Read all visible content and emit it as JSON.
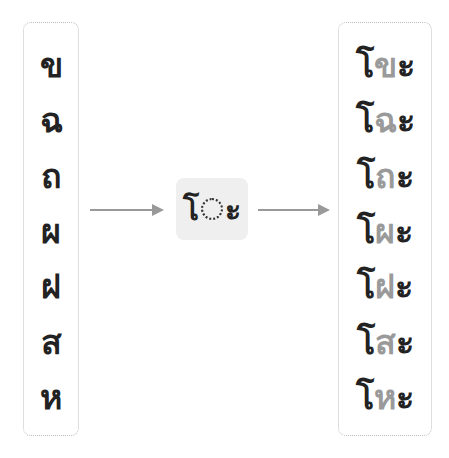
{
  "left_column": {
    "consonants": [
      "ข",
      "ฉ",
      "ถ",
      "ผ",
      "ฝ",
      "ส",
      "ห"
    ]
  },
  "center": {
    "prefix": "โ",
    "placeholder": "dotted-circle",
    "suffix": "ะ"
  },
  "right_column": {
    "rows": [
      {
        "pre": "โ",
        "cons": "ข",
        "post": "ะ"
      },
      {
        "pre": "โ",
        "cons": "ฉ",
        "post": "ะ"
      },
      {
        "pre": "โ",
        "cons": "ถ",
        "post": "ะ"
      },
      {
        "pre": "โ",
        "cons": "ผ",
        "post": "ะ"
      },
      {
        "pre": "โ",
        "cons": "ฝ",
        "post": "ะ"
      },
      {
        "pre": "โ",
        "cons": "ส",
        "post": "ะ"
      },
      {
        "pre": "โ",
        "cons": "ห",
        "post": "ะ"
      }
    ]
  },
  "colors": {
    "text": "#222222",
    "consonant_highlight": "#9a9a9a",
    "arrow": "#999999",
    "center_bg": "#efefef",
    "border": "#bdbdbd"
  }
}
